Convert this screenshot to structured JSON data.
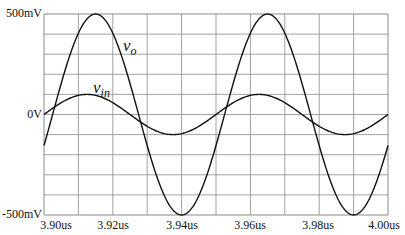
{
  "chart_data": {
    "type": "line",
    "title": "",
    "xlabel": "",
    "ylabel": "",
    "xlim": [
      3.9,
      4.0
    ],
    "ylim": [
      -0.5,
      0.5
    ],
    "x_unit": "us",
    "y_unit": "V",
    "x_ticks": [
      "3.90us",
      "3.92us",
      "3.94us",
      "3.96us",
      "3.98us",
      "4.00us"
    ],
    "y_ticks": [
      "500mV",
      "0V",
      "-500mV"
    ],
    "grid": true,
    "grid_divisions": {
      "x": 10,
      "y": 10
    },
    "series": [
      {
        "name": "v_o",
        "label_main": "v",
        "label_sub": "o",
        "amplitude": 0.5,
        "period": 0.05,
        "phase_start": 3.9025,
        "x": [
          3.9,
          3.9025,
          3.915,
          3.9275,
          3.94,
          3.9525,
          3.965,
          3.9775,
          3.99,
          4.0
        ],
        "values": [
          -0.156,
          0.0,
          0.5,
          0.0,
          -0.5,
          0.0,
          0.5,
          0.0,
          -0.5,
          -0.156
        ]
      },
      {
        "name": "v_in",
        "label_main": "v",
        "label_sub": "in",
        "amplitude": 0.1,
        "period": 0.05,
        "phase_start": 3.9,
        "x": [
          3.9,
          3.9125,
          3.925,
          3.9375,
          3.95,
          3.9625,
          3.975,
          3.9875,
          4.0
        ],
        "values": [
          0.0,
          0.1,
          0.0,
          -0.1,
          0.0,
          0.1,
          0.0,
          -0.1,
          0.0
        ]
      }
    ]
  },
  "labels": {
    "y_top": "500mV",
    "y_mid": "0V",
    "y_bottom": "-500mV",
    "x0": "3.90us",
    "x1": "3.92us",
    "x2": "3.94us",
    "x3": "3.96us",
    "x4": "3.98us",
    "x5": "4.00us",
    "vo_main": "v",
    "vo_sub": "o",
    "vin_main": "v",
    "vin_sub": "in"
  },
  "style": {
    "grid_color": "#8a8a8a",
    "trace_color": "#111111",
    "background": "#ffffff"
  }
}
